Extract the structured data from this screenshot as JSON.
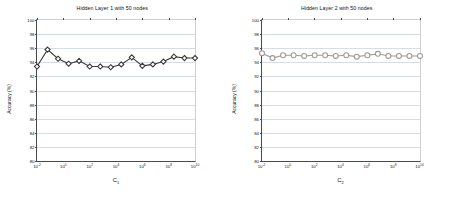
{
  "figure": {
    "background": "#ffffff",
    "panel_count": 2
  },
  "chart_data": [
    {
      "type": "line",
      "panel": "left",
      "title": "Hidden Layer 1 with 50 nodes",
      "xlabel": "C",
      "xlabel_sub": "1",
      "ylabel": "Accuracy (%)",
      "xscale": "log",
      "xlim": [
        0.01,
        10000000000
      ],
      "ylim": [
        80,
        100
      ],
      "yticks": [
        80,
        82,
        84,
        86,
        88,
        90,
        92,
        94,
        96,
        98,
        100
      ],
      "ytick_labels": [
        "80",
        "82",
        "84",
        "86",
        "88",
        "90",
        "92",
        "94",
        "96",
        "98",
        "100"
      ],
      "xticks": [
        0.01,
        1,
        100,
        10000,
        1000000,
        100000000,
        10000000000
      ],
      "xtick_labels": [
        "10-2",
        "100",
        "102",
        "104",
        "106",
        "108",
        "1010"
      ],
      "xtick_mantissa": "10",
      "xtick_exponents": [
        "-2",
        "0",
        "2",
        "4",
        "6",
        "8",
        "10"
      ],
      "grid": true,
      "grid_axis": "y",
      "marker": "diamond",
      "marker_color": "#3a3a3a",
      "line_color": "#3a3a3a",
      "x": [
        0.01,
        0.0631,
        0.398,
        2.512,
        15.85,
        100,
        631,
        3981,
        25119,
        158489,
        1000000,
        6309573,
        39810717,
        251188643,
        1584893192,
        10000000000
      ],
      "values": [
        93.4,
        95.8,
        94.5,
        93.8,
        94.2,
        93.4,
        93.4,
        93.3,
        93.7,
        94.7,
        93.5,
        93.7,
        94.1,
        94.8,
        94.6,
        94.6
      ]
    },
    {
      "type": "line",
      "panel": "right",
      "title": "Hidden Layer 2 with 50 nodes",
      "xlabel": "C",
      "xlabel_sub": "2",
      "ylabel": "Accuracy (%)",
      "xscale": "log",
      "xlim": [
        0.01,
        10000000000
      ],
      "ylim": [
        80,
        100
      ],
      "yticks": [
        80,
        82,
        84,
        86,
        88,
        90,
        92,
        94,
        96,
        98,
        100
      ],
      "ytick_labels": [
        "80",
        "82",
        "84",
        "86",
        "88",
        "90",
        "92",
        "94",
        "96",
        "98",
        "100"
      ],
      "xticks": [
        0.01,
        1,
        100,
        10000,
        1000000,
        100000000,
        10000000000
      ],
      "xtick_labels": [
        "10-2",
        "100",
        "102",
        "104",
        "106",
        "108",
        "1010"
      ],
      "xtick_mantissa": "10",
      "xtick_exponents": [
        "-2",
        "0",
        "2",
        "4",
        "6",
        "8",
        "10"
      ],
      "grid": true,
      "grid_axis": "y",
      "marker": "circle",
      "marker_color": "#9a9a9a",
      "line_color": "#9a9a9a",
      "x": [
        0.01,
        0.0631,
        0.398,
        2.512,
        15.85,
        100,
        631,
        3981,
        25119,
        158489,
        1000000,
        6309573,
        39810717,
        251188643,
        1584893192,
        10000000000
      ],
      "values": [
        95.3,
        94.6,
        95.0,
        95.0,
        94.9,
        95.0,
        95.0,
        94.9,
        95.0,
        94.8,
        95.0,
        95.2,
        94.9,
        94.9,
        94.9,
        94.9
      ]
    }
  ]
}
